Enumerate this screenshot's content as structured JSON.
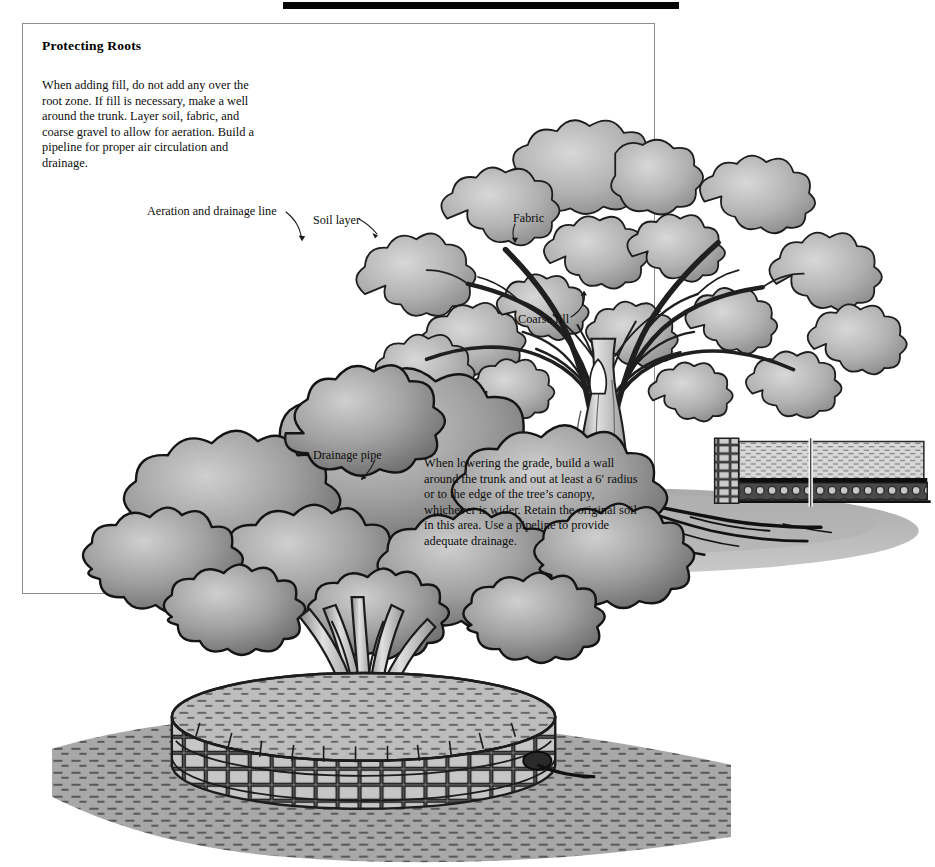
{
  "page": {
    "title": "Protecting Roots",
    "background_color": "#ffffff",
    "frame_color": "#8e8e92",
    "top_bar_color": "#050505"
  },
  "intro": {
    "text": "When adding fill, do not add any over the root zone. If fill is necessary, make a well around the trunk. Layer soil, fabric, and coarse gravel to allow for aeration. Build a pipeline for proper air circulation and drainage."
  },
  "lower_text": {
    "text": "When lowering the grade, build a wall around the trunk and out at least a 6′ radius or to the edge of the tree’s canopy, whichever is wider. Retain the original soil in this area. Use a pipeline to provide adequate drainage."
  },
  "callouts": {
    "aeration": "Aeration and drainage line",
    "soil_layer": "Soil layer",
    "fabric": "Fabric",
    "coarse_fill": "Coarse fill",
    "drainage_pipe": "Drainage pipe"
  },
  "illustrations": {
    "upper": {
      "name": "mature-tree-with-fill-cross-section",
      "description": "Large mature deciduous tree with spreading canopy; ground cross-section on both sides showing layered soil, fabric and coarse gravel fill over the root zone",
      "canopy_fill": "#b9b9b9",
      "canopy_outline": "#1a1a1a",
      "trunk_fill": "#cfcfcf",
      "ground_fill": "#a9a9a9",
      "soil_layer_fill": "#d6d6d6",
      "gravel_fill": "#5a5a5a",
      "fabric_color": "#111111"
    },
    "lower": {
      "name": "multi-trunk-tree-on-retaining-wall",
      "description": "Multi-trunk tree standing on an original-grade soil island retained by a circular stone wall, surrounded by lowered graded ground",
      "canopy_fill": "#9a9a9a",
      "canopy_outline": "#151515",
      "trunk_fill": "#d2d2d2",
      "wall_fill": "#bdbdbd",
      "wall_outline": "#1a1a1a",
      "ground_fill": "#9c9c9c",
      "island_fill": "#b5b5b5"
    }
  }
}
